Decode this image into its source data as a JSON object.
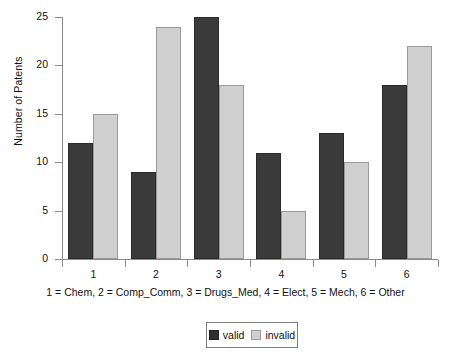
{
  "chart_data": {
    "type": "bar",
    "title": "",
    "xlabel": "1 = Chem, 2 = Comp_Comm, 3 = Drugs_Med, 4 = Elect, 5 = Mech, 6 = Other",
    "ylabel": "Number of Patents",
    "categories": [
      "1",
      "2",
      "3",
      "4",
      "5",
      "6"
    ],
    "category_legend": "1 = Chem, 2 = Comp_Comm, 3 = Drugs_Med, 4 = Elect, 5 = Mech, 6 = Other",
    "series": [
      {
        "name": "valid",
        "color": "#3a3a3a",
        "values": [
          12,
          9,
          25,
          11,
          13,
          18
        ]
      },
      {
        "name": "invalid",
        "color": "#d0d0d0",
        "values": [
          15,
          24,
          18,
          5,
          10,
          22
        ]
      }
    ],
    "ylim": [
      0,
      25
    ],
    "yticks": [
      0,
      5,
      10,
      15,
      20,
      25
    ],
    "ytick_labels": [
      "0",
      "5",
      "10",
      "15",
      "20",
      "25"
    ],
    "grid": false,
    "legend_position": "bottom-center",
    "axis_color": "#8a8a8a",
    "background": "#ffffff"
  },
  "legend": {
    "items": [
      {
        "label": "valid",
        "swatch": "valid"
      },
      {
        "label": "invalid",
        "swatch": "invalid"
      }
    ]
  }
}
